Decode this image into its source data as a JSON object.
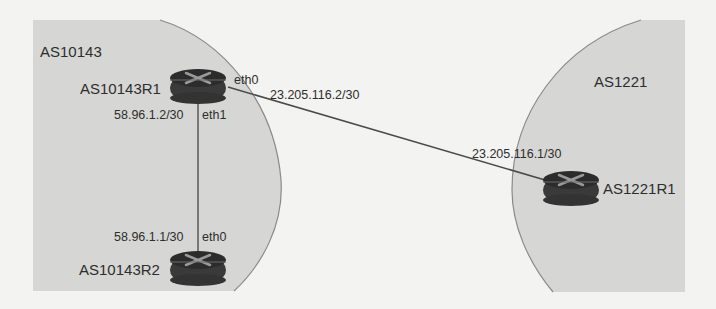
{
  "diagram": {
    "type": "network-topology",
    "colors": {
      "background": "#f3f3f1",
      "region_fill": "#d6d6d4",
      "region_border": "#8a8a8a",
      "router_body": "#3a3a3a",
      "router_top": "#2c2c2c",
      "router_arrows": "#9a9a9a",
      "link": "#4a4a4a",
      "text": "#2e2e2e"
    },
    "regions": [
      {
        "id": "as10143",
        "label": "AS10143"
      },
      {
        "id": "as1221",
        "label": "AS1221"
      }
    ],
    "routers": [
      {
        "id": "r1",
        "name": "AS10143R1",
        "region": "AS10143"
      },
      {
        "id": "r2",
        "name": "AS10143R2",
        "region": "AS10143"
      },
      {
        "id": "r3",
        "name": "AS1221R1",
        "region": "AS1221"
      }
    ],
    "links": [
      {
        "from": "AS10143R1",
        "from_iface": "eth1",
        "from_ip": "58.96.1.2/30",
        "to": "AS10143R2",
        "to_iface": "eth0",
        "to_ip": "58.96.1.1/30"
      },
      {
        "from": "AS10143R1",
        "from_iface": "eth0",
        "from_ip": "23.205.116.2/30",
        "to": "AS1221R1",
        "to_ip": "23.205.116.1/30"
      }
    ],
    "labels": {
      "region_left": "AS10143",
      "region_right": "AS1221",
      "r1_name": "AS10143R1",
      "r2_name": "AS10143R2",
      "r3_name": "AS1221R1",
      "r1_eth0": "eth0",
      "r1_eth1": "eth1",
      "r1_eth1_ip": "58.96.1.2/30",
      "r2_eth0": "eth0",
      "r2_eth0_ip": "58.96.1.1/30",
      "r1_eth0_ip": "23.205.116.2/30",
      "r3_ip": "23.205.116.1/30"
    }
  }
}
